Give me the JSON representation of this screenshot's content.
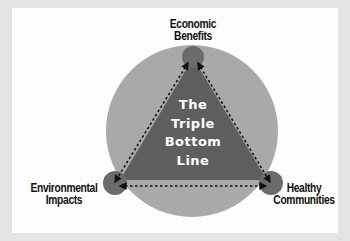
{
  "diagram": {
    "title_lines": [
      "The",
      "Triple",
      "Bottom",
      "Line"
    ],
    "nodes": [
      {
        "id": "top",
        "lines": [
          "Economic",
          "Benefits"
        ]
      },
      {
        "id": "left",
        "lines": [
          "Environmental",
          "Impacts"
        ]
      },
      {
        "id": "right",
        "lines": [
          "Healthy",
          "Communities"
        ]
      }
    ],
    "connectors": [
      {
        "from": "top",
        "to": "left",
        "style": "dashed-arrow-both"
      },
      {
        "from": "top",
        "to": "right",
        "style": "dashed-arrow-both"
      },
      {
        "from": "left",
        "to": "right",
        "style": "dashed-arrow-both"
      }
    ]
  },
  "colors": {
    "frame": "#e4e4e4",
    "background": "#fdfdfd",
    "outer_circle": "#a9a9a9",
    "triangle": "#5e5e5e",
    "vertex_circle": "#6b6b6b",
    "text_dark": "#111111",
    "text_light": "#ffffff"
  }
}
